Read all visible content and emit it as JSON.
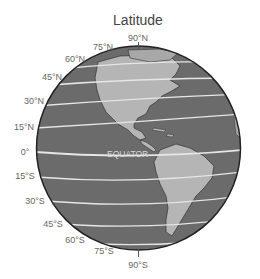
{
  "title": "Latitude",
  "equator_label": "EQUATOR",
  "colors": {
    "ocean": "#6b6b6b",
    "land": "#b5b5b5",
    "lines": "#e6e6e6",
    "outline": "#222222",
    "label": "#666666"
  },
  "labels": [
    {
      "text": "90°N",
      "x": 138,
      "y": 38
    },
    {
      "text": "75°N",
      "x": 103,
      "y": 47
    },
    {
      "text": "60°N",
      "x": 75,
      "y": 59
    },
    {
      "text": "45°N",
      "x": 52,
      "y": 77
    },
    {
      "text": "30°N",
      "x": 34,
      "y": 101
    },
    {
      "text": "15°N",
      "x": 24,
      "y": 127
    },
    {
      "text": "0°",
      "x": 25,
      "y": 152
    },
    {
      "text": "15°S",
      "x": 25,
      "y": 176
    },
    {
      "text": "30°S",
      "x": 35,
      "y": 201
    },
    {
      "text": "45°S",
      "x": 53,
      "y": 224
    },
    {
      "text": "60°S",
      "x": 75,
      "y": 240
    },
    {
      "text": "75°S",
      "x": 104,
      "y": 251
    },
    {
      "text": "90°S",
      "x": 138,
      "y": 265
    }
  ]
}
